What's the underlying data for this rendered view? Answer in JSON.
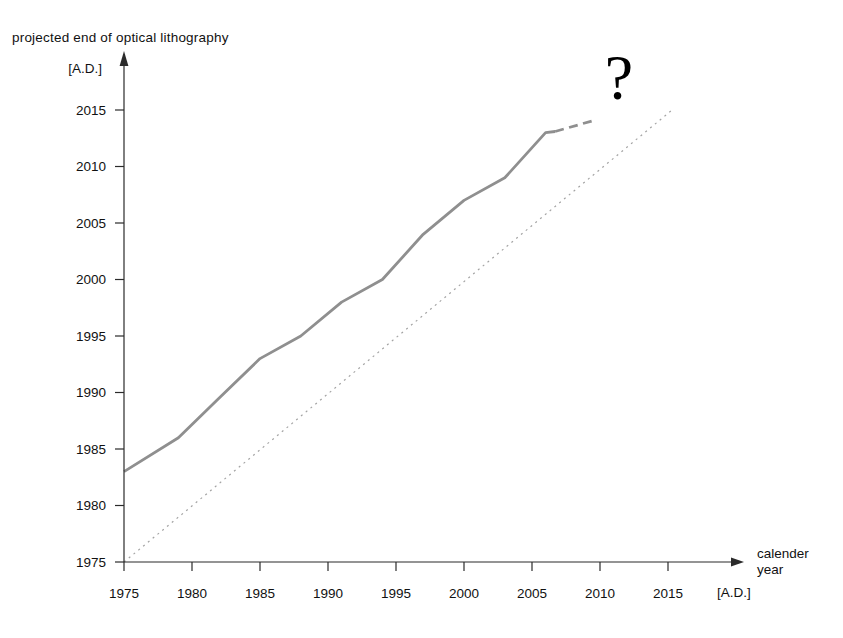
{
  "page": {
    "title": "projected end of optical lithography",
    "y_axis_unit": "[A.D.]",
    "x_axis_unit": "[A.D.]",
    "x_axis_title_line1": "calender",
    "x_axis_title_line2": "year",
    "annotation": "?"
  },
  "colors": {
    "background": "#ffffff",
    "axis": "#2b2b2b",
    "text": "#111111",
    "curve": "#8f8f8f",
    "identity_line": "#a3a3a3",
    "annotation": "#000000"
  },
  "chart_data": {
    "type": "line",
    "title": "projected end of optical lithography",
    "xlabel": "calender year [A.D.]",
    "ylabel": "projected end of optical lithography [A.D.]",
    "xlim": [
      1975,
      2020.5
    ],
    "ylim": [
      1975,
      2020.5
    ],
    "x_ticks": [
      1975,
      1980,
      1985,
      1990,
      1995,
      2000,
      2005,
      2010,
      2015
    ],
    "y_ticks": [
      1975,
      1980,
      1985,
      1990,
      1995,
      2000,
      2005,
      2010,
      2015
    ],
    "grid": false,
    "legend": false,
    "series": [
      {
        "name": "projected end of optical lithography (reported)",
        "style": "solid",
        "points": [
          [
            1975,
            1983
          ],
          [
            1979,
            1986
          ],
          [
            1982,
            1989.5
          ],
          [
            1985,
            1993
          ],
          [
            1988,
            1995
          ],
          [
            1991,
            1998
          ],
          [
            1994,
            2000
          ],
          [
            1997,
            2004
          ],
          [
            2000,
            2007
          ],
          [
            2003,
            2009
          ],
          [
            2006,
            2013
          ],
          [
            2006.7,
            2013.1
          ]
        ]
      },
      {
        "name": "extrapolated projection",
        "style": "dashed",
        "points": [
          [
            2006.7,
            2013.1
          ],
          [
            2009.6,
            2014.1
          ]
        ]
      },
      {
        "name": "identity line (projected end = calender year)",
        "style": "dotted",
        "points": [
          [
            1975,
            1975
          ],
          [
            2015.4,
            2015.1
          ]
        ]
      }
    ],
    "annotation": {
      "text": "?",
      "x": 2011.3,
      "y": 2017.3
    }
  }
}
